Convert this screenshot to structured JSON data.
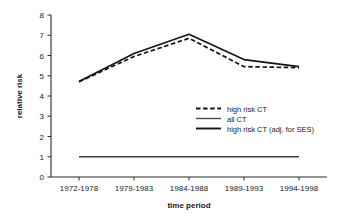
{
  "chart_data": {
    "type": "line",
    "title": "",
    "xlabel": "time period",
    "ylabel": "relative risk",
    "categories": [
      "1972-1978",
      "1979-1983",
      "1984-1988",
      "1989-1993",
      "1994-1998"
    ],
    "ylim": [
      0,
      8
    ],
    "yticks": [
      "0",
      "1",
      "2",
      "3",
      "4",
      "5",
      "6",
      "7",
      "8"
    ],
    "grid": false,
    "legend_position": "center-right",
    "series": [
      {
        "name": "high risk CT",
        "style": "dashed",
        "color": "#1a1a1a",
        "values": [
          4.7,
          5.95,
          6.85,
          5.45,
          5.4
        ]
      },
      {
        "name": "all CT",
        "style": "solid",
        "color": "#3a3a3a",
        "values": [
          1.0,
          1.0,
          1.0,
          1.0,
          1.0
        ]
      },
      {
        "name": "high risk CT (adj. for SES)",
        "style": "solid",
        "color": "#1a1a1a",
        "values": [
          4.72,
          6.1,
          7.05,
          5.8,
          5.45
        ]
      }
    ]
  },
  "axis": {
    "y_title": "relative risk",
    "x_title": "time period",
    "y_labels": [
      "8",
      "7",
      "6",
      "5",
      "4",
      "3",
      "2",
      "1",
      "0"
    ],
    "x_labels": [
      "1972-1978",
      "1979-1983",
      "1984-1988",
      "1989-1993",
      "1994-1998"
    ]
  },
  "legend": {
    "items": [
      {
        "label": "high risk CT",
        "style": "dashed"
      },
      {
        "label": "all CT",
        "style": "solid-gray"
      },
      {
        "label": "high risk CT (adj. for SES)",
        "style": "solid"
      }
    ]
  }
}
